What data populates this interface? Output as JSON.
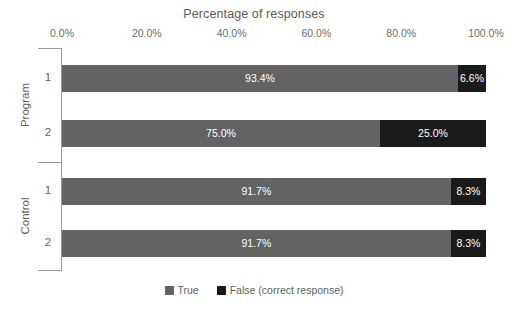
{
  "chart_data": {
    "type": "bar",
    "orientation": "horizontal",
    "stacked": true,
    "stack_mode": "percent",
    "title": "Percentage of responses",
    "xlabel": "",
    "ylabel": "",
    "xlim": [
      0,
      100
    ],
    "grid": false,
    "legend_position": "bottom",
    "axis_color": "#9a9a9a",
    "text_color": "#5f5f5f",
    "x_ticks": [
      {
        "value": 0,
        "label": "0.0%"
      },
      {
        "value": 20,
        "label": "20.0%"
      },
      {
        "value": 40,
        "label": "40.0%"
      },
      {
        "value": 60,
        "label": "60.0%"
      },
      {
        "value": 80,
        "label": "80.0%"
      },
      {
        "value": 100,
        "label": "100.0%"
      }
    ],
    "groups": [
      {
        "label": "Program",
        "categories": [
          "1",
          "2"
        ]
      },
      {
        "label": "Control",
        "categories": [
          "1",
          "2"
        ]
      }
    ],
    "categories": [
      "Program 1",
      "Program 2",
      "Control 1",
      "Control 2"
    ],
    "series": [
      {
        "name": "True",
        "color": "#636363",
        "values": [
          93.4,
          75.0,
          91.7,
          91.7
        ],
        "labels": [
          "93.4%",
          "75.0%",
          "91.7%",
          "91.7%"
        ]
      },
      {
        "name": "False (correct response)",
        "color": "#1a1a1a",
        "values": [
          6.6,
          25.0,
          8.3,
          8.3
        ],
        "labels": [
          "6.6%",
          "25.0%",
          "8.3%",
          "8.3%"
        ]
      }
    ],
    "legend": [
      {
        "label": "True",
        "color": "#636363"
      },
      {
        "label": "False (correct response)",
        "color": "#1a1a1a"
      }
    ],
    "bars": [
      {
        "group": "Program",
        "category": "1",
        "segments": [
          {
            "series": "True",
            "value": 93.4,
            "label": "93.4%",
            "color": "#636363"
          },
          {
            "series": "False (correct response)",
            "value": 6.6,
            "label": "6.6%",
            "color": "#1a1a1a"
          }
        ]
      },
      {
        "group": "Program",
        "category": "2",
        "segments": [
          {
            "series": "True",
            "value": 75.0,
            "label": "75.0%",
            "color": "#636363"
          },
          {
            "series": "False (correct response)",
            "value": 25.0,
            "label": "25.0%",
            "color": "#1a1a1a"
          }
        ]
      },
      {
        "group": "Control",
        "category": "1",
        "segments": [
          {
            "series": "True",
            "value": 91.7,
            "label": "91.7%",
            "color": "#636363"
          },
          {
            "series": "False (correct response)",
            "value": 8.3,
            "label": "8.3%",
            "color": "#1a1a1a"
          }
        ]
      },
      {
        "group": "Control",
        "category": "2",
        "segments": [
          {
            "series": "True",
            "value": 91.7,
            "label": "91.7%",
            "color": "#636363"
          },
          {
            "series": "False (correct response)",
            "value": 8.3,
            "label": "8.3%",
            "color": "#1a1a1a"
          }
        ]
      }
    ]
  },
  "layout": {
    "plot_left": 62,
    "plot_right": 486,
    "plot_width": 424,
    "bar_height": 27,
    "bar_tops": [
      65,
      120,
      178,
      230
    ],
    "group_tick_y": [
      48,
      162,
      270
    ],
    "group_label_centers": [
      105,
      216
    ],
    "row_label_centers": [
      78.5,
      133.5,
      191.5,
      243.5
    ]
  }
}
